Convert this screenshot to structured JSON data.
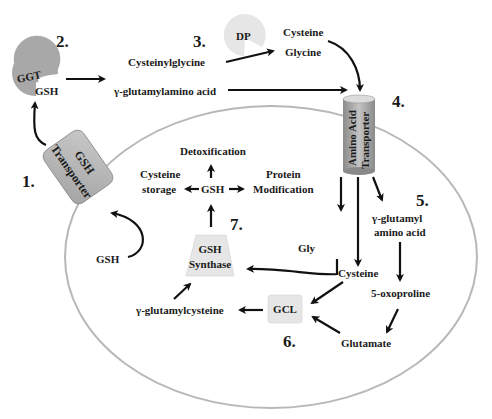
{
  "diagram": {
    "colors": {
      "cell_membrane": "#b8b8b8",
      "enzyme_dark": "#a8a8a8",
      "enzyme_light": "#e6e6e6",
      "text": "#1a1a1a"
    },
    "steps": {
      "s1": "1.",
      "s2": "2.",
      "s3": "3.",
      "s4": "4.",
      "s5": "5.",
      "s6": "6.",
      "s7": "7."
    },
    "enzymes": {
      "ggt": "GGT",
      "dp": "DP",
      "gsh_transporter_line1": "GSH",
      "gsh_transporter_line2": "Transporter",
      "aa_transporter_line1": "Amino Acid",
      "aa_transporter_line2": "Transporter",
      "gsh_synthase_line1": "GSH",
      "gsh_synthase_line2": "Synthase",
      "gcl": "GCL"
    },
    "metabolites": {
      "gsh_at_ggt": "GSH",
      "cysteinylglycine": "Cysteinylglycine",
      "gamma_glutamylamino_acid": "γ-glutamylamino acid",
      "cysteine_extra": "Cysteine",
      "glycine_extra": "Glycine",
      "gsh_intracellular_export": "GSH",
      "detoxification": "Detoxification",
      "cysteine_storage_line1": "Cysteine",
      "cysteine_storage_line2": "storage",
      "gsh_center": "GSH",
      "protein_mod_line1": "Protein",
      "protein_mod_line2": "Modification",
      "gly": "Gly",
      "gamma_glutamyl_line1": "γ-glutamyl",
      "gamma_glutamyl_line2": "amino acid",
      "cysteine_intra": "Cysteine",
      "oxoproline": "5-oxoproline",
      "glutamate": "Glutamate",
      "gamma_glutamylcysteine": "γ-glutamylcysteine"
    }
  }
}
